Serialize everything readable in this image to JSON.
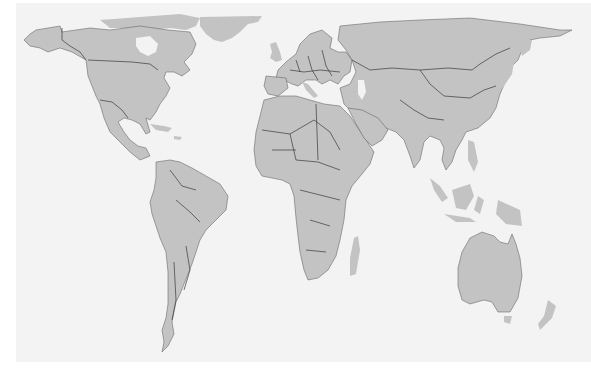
{
  "map": {
    "title": "World map (Gall-Peters equal-area projection)",
    "projection": "Gall-Peters",
    "land_color": "#c3c3c3",
    "ocean_color": "#f3f3f3",
    "border_color": "#3a3a3a",
    "page_background": "#ffffff",
    "labels": [],
    "continents": [
      "North America",
      "South America",
      "Europe",
      "Africa",
      "Asia",
      "Australia",
      "Antarctica-excluded",
      "Greenland",
      "New Zealand"
    ]
  }
}
